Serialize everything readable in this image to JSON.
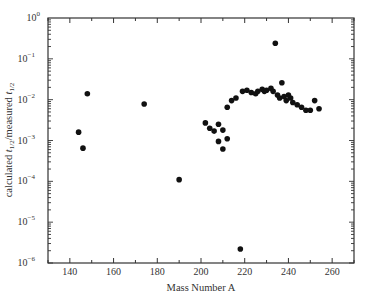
{
  "chart_data": {
    "type": "scatter",
    "title": "",
    "xlabel": "Mass Number A",
    "ylabel": "calculated t1/2/measured t1/2",
    "ylabel_parts": {
      "pre": "calculated ",
      "t1": "t",
      "sub1": "1/2",
      "mid": "/measured ",
      "t2": "t",
      "sub2": "1/2"
    },
    "xlim": [
      130,
      270
    ],
    "ylim": [
      1e-06,
      1
    ],
    "yscale": "log",
    "grid": false,
    "legend": null,
    "xticks": [
      140,
      160,
      180,
      200,
      220,
      240,
      260
    ],
    "yticks": [
      {
        "exp": "0",
        "value": 1
      },
      {
        "exp": "−1",
        "value": 0.1
      },
      {
        "exp": "−2",
        "value": 0.01
      },
      {
        "exp": "−3",
        "value": 0.001
      },
      {
        "exp": "−4",
        "value": 0.0001
      },
      {
        "exp": "−5",
        "value": 1e-05
      },
      {
        "exp": "−6",
        "value": 1e-06
      }
    ],
    "series": [
      {
        "name": "data",
        "color": "#111111",
        "points": [
          {
            "x": 144,
            "y": 0.0016
          },
          {
            "x": 146,
            "y": 0.00065
          },
          {
            "x": 148,
            "y": 0.014
          },
          {
            "x": 174,
            "y": 0.0078
          },
          {
            "x": 190,
            "y": 0.00011
          },
          {
            "x": 202,
            "y": 0.0027
          },
          {
            "x": 204,
            "y": 0.002
          },
          {
            "x": 206,
            "y": 0.0017
          },
          {
            "x": 208,
            "y": 0.0025
          },
          {
            "x": 208,
            "y": 0.00095
          },
          {
            "x": 210,
            "y": 0.0018
          },
          {
            "x": 212,
            "y": 0.0011
          },
          {
            "x": 210,
            "y": 0.00062
          },
          {
            "x": 212,
            "y": 0.0065
          },
          {
            "x": 214,
            "y": 0.0095
          },
          {
            "x": 216,
            "y": 0.011
          },
          {
            "x": 218,
            "y": 2.2e-06
          },
          {
            "x": 219,
            "y": 0.016
          },
          {
            "x": 221,
            "y": 0.017
          },
          {
            "x": 223,
            "y": 0.015
          },
          {
            "x": 225,
            "y": 0.014
          },
          {
            "x": 226,
            "y": 0.016
          },
          {
            "x": 228,
            "y": 0.018
          },
          {
            "x": 229,
            "y": 0.016
          },
          {
            "x": 230,
            "y": 0.017
          },
          {
            "x": 232,
            "y": 0.019
          },
          {
            "x": 233,
            "y": 0.016
          },
          {
            "x": 234,
            "y": 0.24
          },
          {
            "x": 235,
            "y": 0.013
          },
          {
            "x": 236,
            "y": 0.011
          },
          {
            "x": 237,
            "y": 0.026
          },
          {
            "x": 238,
            "y": 0.012
          },
          {
            "x": 239,
            "y": 0.0095
          },
          {
            "x": 240,
            "y": 0.013
          },
          {
            "x": 241,
            "y": 0.011
          },
          {
            "x": 242,
            "y": 0.0085
          },
          {
            "x": 244,
            "y": 0.0075
          },
          {
            "x": 246,
            "y": 0.0065
          },
          {
            "x": 248,
            "y": 0.0055
          },
          {
            "x": 250,
            "y": 0.0055
          },
          {
            "x": 252,
            "y": 0.0095
          },
          {
            "x": 254,
            "y": 0.006
          }
        ]
      }
    ]
  }
}
